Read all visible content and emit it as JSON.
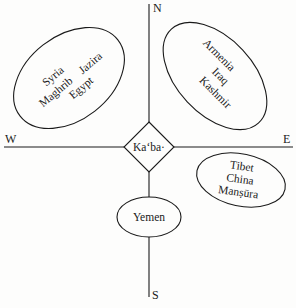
{
  "diagram": {
    "type": "qibla-orientation-diagram",
    "directions": {
      "north": "N",
      "south": "S",
      "east": "E",
      "west": "W"
    },
    "center": {
      "label": "Ka‘ba·"
    },
    "regions": [
      {
        "id": "northwest",
        "labels": [
          "Syria",
          "Maghrib",
          "Jazira",
          "Egypt"
        ]
      },
      {
        "id": "northeast",
        "labels": [
          "Armenia",
          "Iraq",
          "Kashmir"
        ]
      },
      {
        "id": "southeast",
        "labels": [
          "Tibet",
          "China",
          "Manṣūra"
        ]
      },
      {
        "id": "south",
        "labels": [
          "Yemen"
        ]
      }
    ],
    "colors": {
      "ink": "#1a1a1a",
      "paper": "#fdfdfc"
    }
  }
}
